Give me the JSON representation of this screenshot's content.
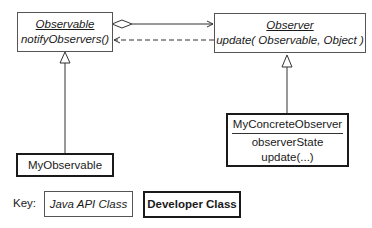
{
  "diagram": {
    "type": "uml-class-diagram",
    "classes": {
      "observable": {
        "name": "Observable",
        "methods": [
          "notifyObservers()"
        ],
        "kind": "Java API Class"
      },
      "observer": {
        "name": "Observer",
        "methods": [
          "update( Observable, Object )"
        ],
        "kind": "Java API Class"
      },
      "my_observable": {
        "name": "MyObservable",
        "kind": "Developer Class"
      },
      "my_concrete_observer": {
        "name": "MyConcreteObserver",
        "attributes": [
          "observerState"
        ],
        "methods": [
          "update(...)"
        ],
        "kind": "Developer Class"
      }
    },
    "relationships": [
      {
        "from": "Observable",
        "to": "Observer",
        "type": "aggregation"
      },
      {
        "from": "Observer",
        "to": "Observable",
        "type": "dependency"
      },
      {
        "from": "MyObservable",
        "to": "Observable",
        "type": "generalization"
      },
      {
        "from": "MyConcreteObserver",
        "to": "Observer",
        "type": "generalization"
      }
    ]
  },
  "key": {
    "label": "Key:",
    "api_label": "Java API Class",
    "dev_label": "Developer Class"
  }
}
